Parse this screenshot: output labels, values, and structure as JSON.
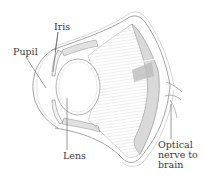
{
  "diagram": {
    "labels": {
      "iris": "Iris",
      "pupil": "Pupil",
      "lens": "Lens",
      "optic_line1": "Optical",
      "optic_line2": "nerve to",
      "optic_line3": "brain"
    },
    "colors": {
      "outline": "#8a8a8a",
      "hatch": "#b5b5b5",
      "shade": "#d6d6d6",
      "text": "#3a3a3a",
      "background": "#ffffff"
    }
  }
}
